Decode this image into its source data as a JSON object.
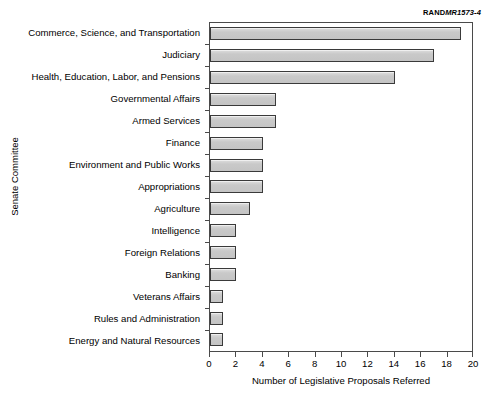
{
  "figure": {
    "source_code_prefix": "RAND",
    "source_code_suffix": "MR1573-4"
  },
  "chart_data": {
    "type": "bar",
    "orientation": "horizontal",
    "title": "",
    "xlabel": "Number of Legislative Proposals Referred",
    "ylabel": "Senate Committee",
    "xlim": [
      0,
      20
    ],
    "xticks": [
      0,
      2,
      4,
      6,
      8,
      10,
      12,
      14,
      16,
      18,
      20
    ],
    "xtick_labels": [
      "0",
      "2",
      "4",
      "6",
      "8",
      "10",
      "12",
      "14",
      "16",
      "18",
      "20"
    ],
    "grid": false,
    "legend": "none",
    "bar_fill_color": "#c8c8c8",
    "bar_edge_color": "#3a3a3a",
    "categories": [
      "Commerce, Science, and Transportation",
      "Judiciary",
      "Health, Education, Labor, and Pensions",
      "Governmental Affairs",
      "Armed Services",
      "Finance",
      "Environment and Public Works",
      "Appropriations",
      "Agriculture",
      "Intelligence",
      "Foreign Relations",
      "Banking",
      "Veterans Affairs",
      "Rules and Administration",
      "Energy and Natural Resources"
    ],
    "values": [
      19,
      17,
      14,
      5,
      5,
      4,
      4,
      4,
      3,
      2,
      2,
      2,
      1,
      1,
      1
    ]
  }
}
